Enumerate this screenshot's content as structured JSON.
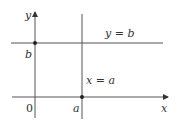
{
  "diagram": {
    "axes": {
      "x_label": "x",
      "y_label": "y",
      "origin_label": "0"
    },
    "ticks": {
      "a_label": "a",
      "b_label": "b"
    },
    "lines": {
      "horizontal_label": "y = b",
      "vertical_label": "x = a"
    },
    "colors": {
      "line": "#555555",
      "axis": "#444444",
      "point": "#222222",
      "text": "#333333"
    }
  }
}
